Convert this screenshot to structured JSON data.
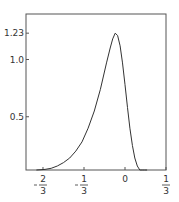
{
  "chart_data": {
    "type": "line",
    "title": "",
    "xlabel": "",
    "ylabel": "",
    "xlim": [
      -0.72,
      0.333
    ],
    "ylim": [
      -0.03,
      1.38
    ],
    "grid": false,
    "legend": null,
    "x_ticks": [
      {
        "value": -0.6667,
        "label": "-2/3",
        "num": "2",
        "den": "3",
        "neg": true
      },
      {
        "value": -0.3333,
        "label": "-1/3",
        "num": "1",
        "den": "3",
        "neg": true
      },
      {
        "value": 0,
        "label": "0"
      },
      {
        "value": 0.3333,
        "label": "1/3",
        "num": "1",
        "den": "3",
        "neg": false
      }
    ],
    "y_ticks": [
      {
        "value": 0.5,
        "label": "0.5"
      },
      {
        "value": 1.0,
        "label": "1.0"
      },
      {
        "value": 1.23,
        "label": "1.23"
      }
    ],
    "series": [
      {
        "name": "density",
        "color": "#333333",
        "x": [
          -0.72,
          -0.65,
          -0.6,
          -0.55,
          -0.5,
          -0.45,
          -0.4,
          -0.35,
          -0.3,
          -0.25,
          -0.2,
          -0.15,
          -0.12,
          -0.1,
          -0.08,
          -0.06,
          -0.04,
          -0.02,
          0.0,
          0.02,
          0.04,
          0.06,
          0.08,
          0.1,
          0.12,
          0.14,
          0.16,
          0.18
        ],
        "y": [
          0.03,
          0.04,
          0.05,
          0.07,
          0.1,
          0.14,
          0.2,
          0.28,
          0.4,
          0.55,
          0.74,
          0.97,
          1.1,
          1.18,
          1.23,
          1.21,
          1.12,
          0.97,
          0.78,
          0.58,
          0.4,
          0.25,
          0.14,
          0.07,
          0.03,
          0.01,
          0.0,
          0.0
        ]
      }
    ]
  }
}
